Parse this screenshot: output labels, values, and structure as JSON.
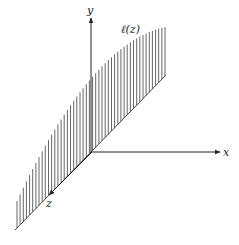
{
  "diagram": {
    "type": "3d-axes-with-hatched-surface",
    "axes": [
      {
        "name": "x",
        "label": "x",
        "from": [
          92,
          152
        ],
        "to": [
          220,
          152
        ]
      },
      {
        "name": "y",
        "label": "y",
        "from": [
          91,
          152
        ],
        "to": [
          91,
          18
        ]
      },
      {
        "name": "z",
        "label": "z",
        "from": [
          92,
          152
        ],
        "to": [
          48,
          196
        ]
      }
    ],
    "curve_label": "ℓ(z)",
    "baseline": {
      "from": [
        15,
        230
      ],
      "to": [
        166,
        75
      ]
    },
    "hatch": {
      "count": 48,
      "spacing": 3.15,
      "color": "#444444"
    },
    "colors": {
      "axis": "#222222",
      "hatch": "#555555",
      "background": "#ffffff"
    }
  }
}
